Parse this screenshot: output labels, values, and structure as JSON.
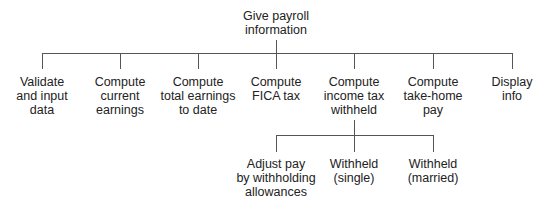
{
  "root": {
    "label": "Give payroll\ninformation"
  },
  "level1": [
    {
      "label": "Validate\nand input\ndata"
    },
    {
      "label": "Compute\ncurrent\nearnings"
    },
    {
      "label": "Compute\ntotal earnings\nto date"
    },
    {
      "label": "Compute\nFICA tax"
    },
    {
      "label": "Compute\nincome tax\nwithheld"
    },
    {
      "label": "Compute\ntake-home\npay"
    },
    {
      "label": "Display\ninfo"
    }
  ],
  "level2": [
    {
      "label": "Adjust pay\nby withholding\nallowances"
    },
    {
      "label": "Withheld\n(single)"
    },
    {
      "label": "Withheld\n(married)"
    }
  ]
}
